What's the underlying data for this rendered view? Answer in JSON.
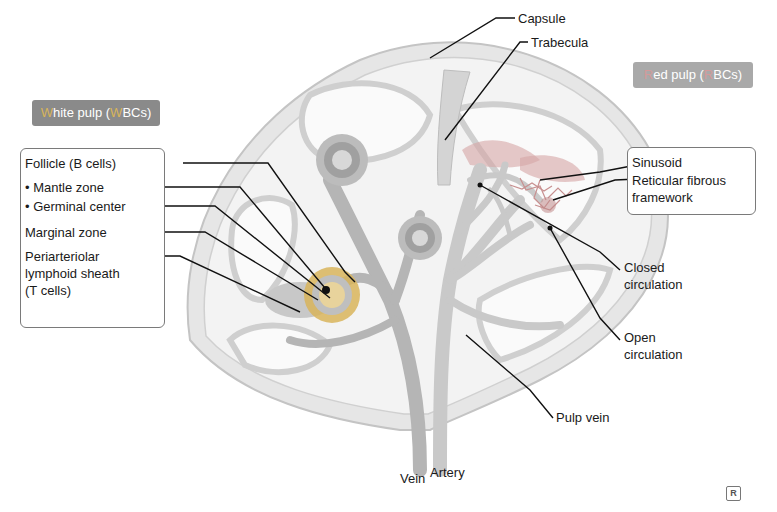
{
  "colors": {
    "white_pulp_header": "#8a8a8a",
    "white_pulp_accent": "#d8b45a",
    "red_pulp_header": "#a9a9a9",
    "red_pulp_accent": "#d0a0a0",
    "capsule_outer": "#dcdcdc",
    "parenchyma": "#e9e9e9",
    "vessel": "#b8b8b8",
    "vessel_dark": "#8f8f8f",
    "leader_line": "#111111"
  },
  "white_pulp": {
    "header": {
      "first_letter": "W",
      "rest": "hite pulp (",
      "mid_letter": "W",
      "end": "BCs)"
    },
    "items": [
      "Follicle (B cells)",
      "• Mantle zone",
      "• Germinal center",
      "Marginal zone",
      "Periarteriolar",
      "lymphoid sheath",
      "(T cells)"
    ]
  },
  "red_pulp": {
    "header": {
      "first_letter": "R",
      "rest": "ed pulp (",
      "mid_letter": "R",
      "end": "BCs)"
    },
    "items": [
      "Sinusoid",
      "Reticular fibrous",
      "framework"
    ]
  },
  "labels": {
    "capsule": "Capsule",
    "trabecula": "Trabecula",
    "closed_circulation_1": "Closed",
    "closed_circulation_2": "circulation",
    "open_circulation_1": "Open",
    "open_circulation_2": "circulation",
    "pulp_vein": "Pulp vein",
    "vein": "Vein",
    "artery": "Artery"
  },
  "logo": "R"
}
